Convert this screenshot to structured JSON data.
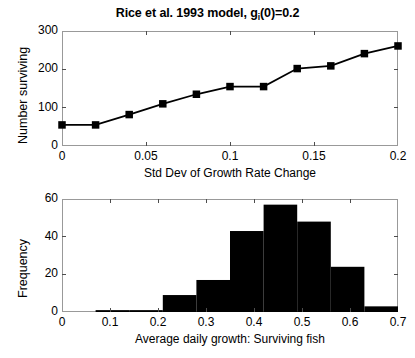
{
  "figure": {
    "title_main": "Rice et al. 1993 model, g",
    "title_sub": "i",
    "title_tail": "(0)=0.2",
    "background": "#ffffff",
    "ink": "#000000",
    "axis_color": "#999999"
  },
  "chart_data": [
    {
      "type": "line",
      "title": "Rice et al. 1993 model, g_i(0)=0.2",
      "xlabel": "Std Dev of Growth Rate Change",
      "ylabel": "Number surviving",
      "xlim": [
        0,
        0.2
      ],
      "ylim": [
        0,
        300
      ],
      "xticks": [
        0,
        0.05,
        0.1,
        0.15,
        0.2
      ],
      "xticklabels": [
        "0",
        "0.05",
        "0.1",
        "0.15",
        "0.2"
      ],
      "yticks": [
        0,
        100,
        200,
        300
      ],
      "yticklabels": [
        "0",
        "100",
        "200",
        "300"
      ],
      "grid": false,
      "legend": null,
      "marker": "square",
      "marker_color": "#000000",
      "line_color": "#000000",
      "x": [
        0,
        0.02,
        0.04,
        0.06,
        0.08,
        0.1,
        0.12,
        0.14,
        0.16,
        0.18,
        0.2
      ],
      "values": [
        55,
        55,
        82,
        110,
        135,
        155,
        155,
        202,
        209,
        241,
        261
      ]
    },
    {
      "type": "bar",
      "title": "",
      "xlabel": "Average daily growth: Surviving fish",
      "ylabel": "Frequency",
      "xlim": [
        0,
        0.7
      ],
      "ylim": [
        0,
        60
      ],
      "xticks": [
        0,
        0.1,
        0.2,
        0.3,
        0.4,
        0.5,
        0.6,
        0.7
      ],
      "xticklabels": [
        "0",
        "0.1",
        "0.2",
        "0.3",
        "0.4",
        "0.5",
        "0.6",
        "0.7"
      ],
      "yticks": [
        0,
        20,
        40,
        60
      ],
      "yticklabels": [
        "0",
        "20",
        "40",
        "60"
      ],
      "grid": false,
      "legend": null,
      "bar_color": "#000000",
      "bin_edges": [
        0.07,
        0.14,
        0.21,
        0.28,
        0.35,
        0.42,
        0.49,
        0.56,
        0.63,
        0.7
      ],
      "categories": [
        "0.07-0.14",
        "0.14-0.21",
        "0.21-0.28",
        "0.28-0.35",
        "0.35-0.42",
        "0.42-0.49",
        "0.49-0.56",
        "0.56-0.63",
        "0.63-0.70"
      ],
      "values": [
        1,
        1,
        9,
        17,
        43,
        57,
        48,
        24,
        3
      ]
    }
  ]
}
